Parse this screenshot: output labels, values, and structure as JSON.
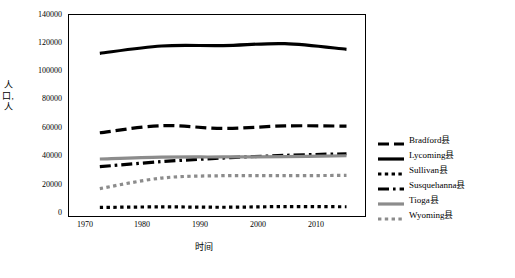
{
  "chart_data": {
    "type": "line",
    "title": "",
    "xlabel": "时间",
    "ylabel": "人口, 人",
    "xlim": [
      1965,
      2013
    ],
    "ylim": [
      0,
      140000
    ],
    "xticks": [
      "1970",
      "1980",
      "1990",
      "2000",
      "2010"
    ],
    "xtickvals": [
      1970,
      1980,
      1990,
      2000,
      2010
    ],
    "yticks": [
      "0",
      "20000",
      "40000",
      "60000",
      "80000",
      "100000",
      "120000",
      "140000"
    ],
    "ytickvals": [
      0,
      20000,
      40000,
      60000,
      80000,
      100000,
      120000,
      140000
    ],
    "grid": false,
    "legend_position": "right",
    "x": [
      1970,
      1980,
      1990,
      2000,
      2010
    ],
    "series": [
      {
        "name": "Bradford县",
        "key_style": "dashed-thick",
        "color": "#000000",
        "values": [
          57962,
          62919,
          60967,
          62761,
          62622
        ]
      },
      {
        "name": "Lycoming县",
        "key_style": "solid-thick",
        "color": "#000000",
        "values": [
          113296,
          118416,
          118710,
          120044,
          116111
        ]
      },
      {
        "name": "Sullivan县",
        "key_style": "dotted-thick",
        "color": "#000000",
        "values": [
          5961,
          6349,
          6104,
          6556,
          6428
        ]
      },
      {
        "name": "Susquehanna县",
        "key_style": "dash-dot",
        "color": "#000000",
        "values": [
          34344,
          37876,
          40380,
          42238,
          43356
        ]
      },
      {
        "name": "Tioga县",
        "key_style": "solid-gray",
        "color": "#808080",
        "values": [
          39691,
          40973,
          41126,
          41373,
          41981
        ]
      },
      {
        "name": "Wyoming县",
        "key_style": "dotted-gray",
        "color": "#808080",
        "values": [
          19082,
          26433,
          28076,
          28080,
          28276
        ]
      }
    ]
  }
}
